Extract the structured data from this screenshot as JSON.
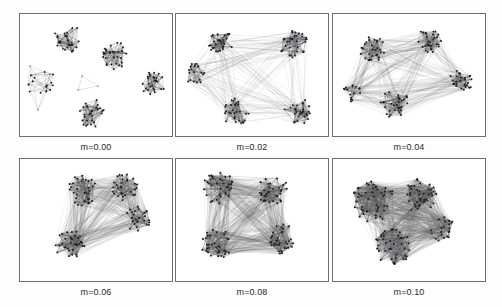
{
  "figure": {
    "background_color": "#fdfdfd",
    "panel_border_color": "#6e6e72",
    "node_color": "#1e1e22",
    "edge_color": "#5a5a5e",
    "rows": 2,
    "columns": 3
  },
  "panels": [
    {
      "id": "panel-m-000",
      "label": "m=0.00",
      "mixing_parameter": 0.0,
      "community_count": 5,
      "description": "five fully separated communities, no inter-community edges",
      "inter_edge_density": 0.0
    },
    {
      "id": "panel-m-002",
      "label": "m=0.02",
      "mixing_parameter": 0.02,
      "community_count": 5,
      "description": "communities still distinct, sparse inter-community edges appear",
      "inter_edge_density": 0.2
    },
    {
      "id": "panel-m-004",
      "label": "m=0.04",
      "mixing_parameter": 0.04,
      "community_count": 5,
      "description": "communities visible but linked by many crossing edges",
      "inter_edge_density": 0.4
    },
    {
      "id": "panel-m-006",
      "label": "m=0.06",
      "mixing_parameter": 0.06,
      "community_count": 4,
      "description": "communities begin to merge, layout contracts",
      "inter_edge_density": 0.6
    },
    {
      "id": "panel-m-008",
      "label": "m=0.08",
      "mixing_parameter": 0.08,
      "community_count": 4,
      "description": "dense mesh, community boundaries blurred",
      "inter_edge_density": 0.8
    },
    {
      "id": "panel-m-010",
      "label": "m=0.10",
      "mixing_parameter": 0.1,
      "community_count": 2,
      "description": "communities largely dissolved into one dense blob",
      "inter_edge_density": 1.0
    }
  ],
  "chart_data": {
    "type": "scatter",
    "xlabel": "",
    "ylabel": "",
    "legend_position": "none",
    "grid": false,
    "panel_labels": [
      "m=0.00",
      "m=0.02",
      "m=0.04",
      "m=0.06",
      "m=0.08",
      "m=0.10"
    ],
    "x": [
      0.0,
      0.02,
      0.04,
      0.06,
      0.08,
      0.1
    ],
    "series": [
      {
        "name": "communities visible",
        "values": [
          5,
          5,
          5,
          4,
          4,
          2
        ]
      },
      {
        "name": "inter-community edge density",
        "values": [
          0.0,
          0.2,
          0.4,
          0.6,
          0.8,
          1.0
        ]
      }
    ],
    "panels": [
      {
        "label": "m=0.00",
        "clusters": [
          {
            "cx": 48,
            "cy": 25,
            "r": 15,
            "n": 30
          },
          {
            "cx": 95,
            "cy": 42,
            "r": 15,
            "n": 30
          },
          {
            "cx": 133,
            "cy": 70,
            "r": 13,
            "n": 28
          },
          {
            "cx": 73,
            "cy": 100,
            "r": 15,
            "n": 30
          },
          {
            "cx": 22,
            "cy": 70,
            "r": 15,
            "n": 14
          }
        ],
        "inter_edges": 0
      },
      {
        "label": "m=0.02",
        "clusters": [
          {
            "cx": 45,
            "cy": 28,
            "r": 13,
            "n": 30
          },
          {
            "cx": 118,
            "cy": 30,
            "r": 15,
            "n": 32
          },
          {
            "cx": 18,
            "cy": 60,
            "r": 11,
            "n": 22
          },
          {
            "cx": 60,
            "cy": 98,
            "r": 14,
            "n": 30
          },
          {
            "cx": 122,
            "cy": 97,
            "r": 14,
            "n": 30
          }
        ],
        "inter_edges": 150
      },
      {
        "label": "m=0.04",
        "clusters": [
          {
            "cx": 40,
            "cy": 36,
            "r": 14,
            "n": 30
          },
          {
            "cx": 96,
            "cy": 27,
            "r": 13,
            "n": 30
          },
          {
            "cx": 128,
            "cy": 68,
            "r": 13,
            "n": 28
          },
          {
            "cx": 62,
            "cy": 90,
            "r": 15,
            "n": 32
          },
          {
            "cx": 20,
            "cy": 78,
            "r": 10,
            "n": 16
          }
        ],
        "inter_edges": 300
      },
      {
        "label": "m=0.06",
        "clusters": [
          {
            "cx": 62,
            "cy": 32,
            "r": 16,
            "n": 34
          },
          {
            "cx": 104,
            "cy": 28,
            "r": 14,
            "n": 30
          },
          {
            "cx": 118,
            "cy": 60,
            "r": 13,
            "n": 28
          },
          {
            "cx": 50,
            "cy": 86,
            "r": 16,
            "n": 36
          }
        ],
        "inter_edges": 440
      },
      {
        "label": "m=0.08",
        "clusters": [
          {
            "cx": 42,
            "cy": 28,
            "r": 17,
            "n": 36
          },
          {
            "cx": 96,
            "cy": 30,
            "r": 16,
            "n": 34
          },
          {
            "cx": 40,
            "cy": 85,
            "r": 16,
            "n": 34
          },
          {
            "cx": 108,
            "cy": 80,
            "r": 16,
            "n": 34
          }
        ],
        "inter_edges": 620
      },
      {
        "label": "m=0.10",
        "clusters": [
          {
            "cx": 40,
            "cy": 42,
            "r": 22,
            "n": 48
          },
          {
            "cx": 88,
            "cy": 36,
            "r": 19,
            "n": 42
          },
          {
            "cx": 60,
            "cy": 88,
            "r": 19,
            "n": 42
          },
          {
            "cx": 110,
            "cy": 70,
            "r": 13,
            "n": 22
          }
        ],
        "inter_edges": 820
      }
    ]
  }
}
